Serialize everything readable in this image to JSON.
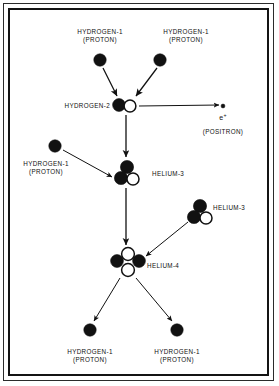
{
  "figure": {
    "width": 279,
    "height": 386,
    "background": "#ffffff",
    "ink_color": "#111111",
    "border": {
      "outer_color": "#2b2b2b",
      "inner_color": "#141414"
    }
  },
  "legend": {
    "filled_circle_means": "proton",
    "open_circle_means": "neutron",
    "proton_fill": "#111111",
    "neutron_fill": "#ffffff",
    "neutron_stroke": "#111111"
  },
  "nodes": [
    {
      "id": "h1-top-left",
      "label_line1": "HYDROGEN-1",
      "label_line2": "(PROTON)",
      "label_x": 100,
      "label_y": 28,
      "label_align": "center",
      "particles": [
        {
          "type": "proton",
          "cx": 100,
          "cy": 60,
          "r": 6.2
        }
      ]
    },
    {
      "id": "h1-top-right",
      "label_line1": "HYDROGEN-1",
      "label_line2": "(PROTON)",
      "label_x": 186,
      "label_y": 28,
      "label_align": "center",
      "particles": [
        {
          "type": "proton",
          "cx": 160,
          "cy": 60,
          "r": 6.2
        }
      ]
    },
    {
      "id": "h2",
      "label_line1": "HYDROGEN-2",
      "label_line2": "",
      "label_x": 110,
      "label_y": 102,
      "label_align": "right",
      "particles": [
        {
          "type": "proton",
          "cx": 119,
          "cy": 105,
          "r": 6.4
        },
        {
          "type": "neutron",
          "cx": 130,
          "cy": 106,
          "r": 5.9
        }
      ]
    },
    {
      "id": "positron",
      "label_line1": "(POSITRON)",
      "label_line2": "",
      "label_x": 223,
      "label_y": 128,
      "label_align": "center",
      "particles": [
        {
          "type": "proton",
          "cx": 223,
          "cy": 106,
          "r": 1.9
        }
      ]
    },
    {
      "id": "h1-left",
      "label_line1": "HYDROGEN-1",
      "label_line2": "(PROTON)",
      "label_x": 46,
      "label_y": 160,
      "label_align": "center",
      "particles": [
        {
          "type": "proton",
          "cx": 55,
          "cy": 146,
          "r": 6.2
        }
      ]
    },
    {
      "id": "he3-center",
      "label_line1": "HELIUM-3",
      "label_line2": "",
      "label_x": 152,
      "label_y": 170,
      "label_align": "left",
      "particles": [
        {
          "type": "proton",
          "cx": 127,
          "cy": 167,
          "r": 6.6
        },
        {
          "type": "proton",
          "cx": 121,
          "cy": 178,
          "r": 6.6
        },
        {
          "type": "neutron",
          "cx": 133,
          "cy": 179,
          "r": 6.0
        }
      ]
    },
    {
      "id": "he3-right",
      "label_line1": "HELIUM-3",
      "label_line2": "",
      "label_x": 213,
      "label_y": 204,
      "label_align": "left",
      "particles": [
        {
          "type": "proton",
          "cx": 200,
          "cy": 206,
          "r": 6.6
        },
        {
          "type": "proton",
          "cx": 194,
          "cy": 217,
          "r": 6.6
        },
        {
          "type": "neutron",
          "cx": 206,
          "cy": 218,
          "r": 6.0
        }
      ]
    },
    {
      "id": "he4",
      "label_line1": "HELIUM-4",
      "label_line2": "",
      "label_x": 147,
      "label_y": 262,
      "label_align": "left",
      "particles": [
        {
          "type": "neutron",
          "cx": 128,
          "cy": 254,
          "r": 6.4
        },
        {
          "type": "proton",
          "cx": 117,
          "cy": 261,
          "r": 6.4
        },
        {
          "type": "proton",
          "cx": 139,
          "cy": 261,
          "r": 6.4
        },
        {
          "type": "neutron",
          "cx": 128,
          "cy": 270,
          "r": 6.4
        }
      ]
    },
    {
      "id": "h1-bottom-left",
      "label_line1": "HYDROGEN-1",
      "label_line2": "(PROTON)",
      "label_x": 90,
      "label_y": 348,
      "label_align": "center",
      "particles": [
        {
          "type": "proton",
          "cx": 90,
          "cy": 330,
          "r": 6.2
        }
      ]
    },
    {
      "id": "h1-bottom-right",
      "label_line1": "HYDROGEN-1",
      "label_line2": "(PROTON)",
      "label_x": 177,
      "label_y": 348,
      "label_align": "center",
      "particles": [
        {
          "type": "proton",
          "cx": 177,
          "cy": 330,
          "r": 6.2
        }
      ]
    }
  ],
  "positron_symbol": {
    "base": "e",
    "charge": "+",
    "x": 223,
    "y": 112
  },
  "arrows": [
    {
      "id": "arrow-h1tl-to-h2",
      "x1": 103,
      "y1": 68,
      "x2": 117,
      "y2": 96,
      "width": 1.3
    },
    {
      "id": "arrow-h1tr-to-h2",
      "x1": 157,
      "y1": 68,
      "x2": 136,
      "y2": 96,
      "width": 1.3
    },
    {
      "id": "arrow-h2-to-positron",
      "x1": 139,
      "y1": 106,
      "x2": 219,
      "y2": 105,
      "width": 1.0
    },
    {
      "id": "arrow-h2-to-he3",
      "x1": 126,
      "y1": 115,
      "x2": 126,
      "y2": 157,
      "width": 1.3
    },
    {
      "id": "arrow-h1left-to-he3",
      "x1": 63,
      "y1": 150,
      "x2": 112,
      "y2": 177,
      "width": 1.0
    },
    {
      "id": "arrow-he3-to-he4",
      "x1": 126,
      "y1": 188,
      "x2": 126,
      "y2": 245,
      "width": 1.3
    },
    {
      "id": "arrow-he3right-to-he4",
      "x1": 188,
      "y1": 222,
      "x2": 146,
      "y2": 256,
      "width": 1.0
    },
    {
      "id": "arrow-he4-to-h1bl",
      "x1": 120,
      "y1": 278,
      "x2": 94,
      "y2": 321,
      "width": 1.0
    },
    {
      "id": "arrow-he4-to-h1br",
      "x1": 136,
      "y1": 278,
      "x2": 172,
      "y2": 321,
      "width": 1.0
    }
  ]
}
